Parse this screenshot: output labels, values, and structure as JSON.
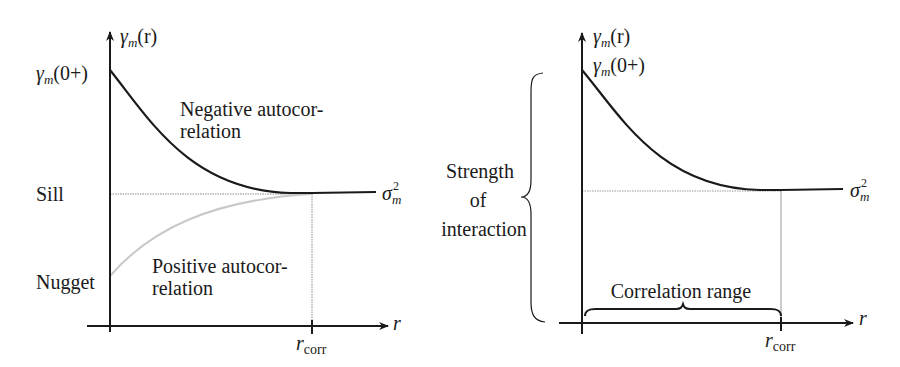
{
  "left_panel": {
    "y_axis_label": {
      "base": "γ",
      "sub": "m",
      "arg": "(r)"
    },
    "y_intercept_label": {
      "base": "γ",
      "sub": "m",
      "arg": "(0+)"
    },
    "sill_label": "Sill",
    "nugget_label": "Nugget",
    "asymptote_label": {
      "base": "σ",
      "sup": "2",
      "sub": "m"
    },
    "x_axis_label": "r",
    "x_tick_label": {
      "base": "r",
      "sub": "corr"
    },
    "negative_text": [
      "Negative autocor-",
      "relation"
    ],
    "positive_text": [
      "Positive autocor-",
      "relation"
    ]
  },
  "right_panel": {
    "y_axis_label": {
      "base": "γ",
      "sub": "m",
      "arg": "(r)"
    },
    "y_intercept_label": {
      "base": "γ",
      "sub": "m",
      "arg": "(0+)"
    },
    "strength_text": [
      "Strength",
      "of",
      "interaction"
    ],
    "range_text": "Correlation range",
    "asymptote_label": {
      "base": "σ",
      "sup": "2",
      "sub": "m"
    },
    "x_axis_label": "r",
    "x_tick_label": {
      "base": "r",
      "sub": "corr"
    }
  },
  "colors": {
    "ink": "#1a1a1a",
    "positive_curve": "#c8c8c8",
    "guide_line": "#8a8a8a"
  }
}
